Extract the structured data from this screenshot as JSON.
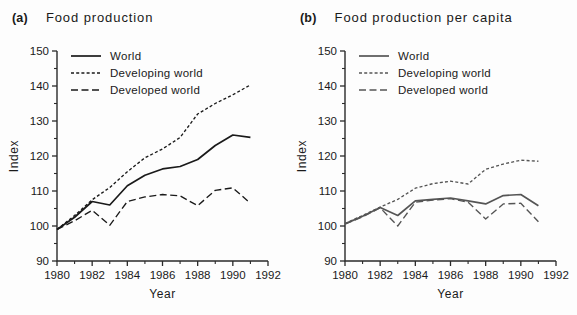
{
  "figure": {
    "background": "#fdfdfd",
    "ink": "#1a1a1a"
  },
  "panels": [
    {
      "tag": "(a)",
      "title": "Food production"
    },
    {
      "tag": "(b)",
      "title": "Food production per capita"
    }
  ],
  "legend": {
    "entries": [
      {
        "label": "World",
        "style": "solid"
      },
      {
        "label": "Developing world",
        "style": "dotted"
      },
      {
        "label": "Developed world",
        "style": "dashed"
      }
    ]
  },
  "axes": {
    "xlabel": "Year",
    "ylabel": "Index",
    "xticks": [
      1980,
      1982,
      1984,
      1986,
      1988,
      1990,
      1992
    ],
    "xtick_labels": [
      "1980",
      "1982",
      "1984",
      "1986",
      "1988",
      "1990",
      "1992"
    ],
    "yticks": [
      90,
      100,
      110,
      120,
      130,
      140,
      150
    ],
    "ytick_labels": [
      "90",
      "100",
      "110",
      "120",
      "130",
      "140",
      "150"
    ],
    "xlim": [
      1980,
      1992
    ],
    "ylim": [
      90,
      150
    ],
    "minor_x_ticks": [
      1981,
      1983,
      1985,
      1987,
      1989,
      1991
    ],
    "minor_y_ticks": [
      95,
      105,
      115,
      125,
      135,
      145
    ],
    "grid": false
  },
  "chart_data": [
    {
      "type": "line",
      "panel": "(a)",
      "title": "Food production",
      "xlabel": "Year",
      "ylabel": "Index",
      "xlim": [
        1980,
        1992
      ],
      "ylim": [
        90,
        150
      ],
      "grid": false,
      "legend_position": "top-left inside axes",
      "x": [
        1980,
        1981,
        1982,
        1983,
        1984,
        1985,
        1986,
        1987,
        1988,
        1989,
        1990,
        1991
      ],
      "series": [
        {
          "name": "World",
          "style": "solid",
          "color": "#1a1a1a",
          "values": [
            99,
            102.5,
            107,
            106,
            111.5,
            114.5,
            116.3,
            117,
            119,
            123,
            126,
            125.3
          ]
        },
        {
          "name": "Developing world",
          "style": "dotted",
          "color": "#1a1a1a",
          "values": [
            99,
            103,
            107.5,
            111,
            115.5,
            119.5,
            122,
            125.3,
            132,
            135,
            137.5,
            140.3
          ]
        },
        {
          "name": "Developed world",
          "style": "dashed",
          "color": "#1a1a1a",
          "values": [
            99,
            101.5,
            104.5,
            100.2,
            107,
            108.3,
            109,
            108.6,
            105.8,
            110.2,
            110.9,
            106.5
          ]
        }
      ]
    },
    {
      "type": "line",
      "panel": "(b)",
      "title": "Food production per capita",
      "xlabel": "Year",
      "ylabel": "Index",
      "xlim": [
        1980,
        1992
      ],
      "ylim": [
        90,
        150
      ],
      "grid": false,
      "legend_position": "top-left inside axes",
      "x": [
        1980,
        1981,
        1982,
        1983,
        1984,
        1985,
        1986,
        1987,
        1988,
        1989,
        1990,
        1991
      ],
      "series": [
        {
          "name": "World",
          "style": "solid",
          "color": "#555555",
          "values": [
            100.6,
            102.8,
            105.3,
            103,
            107.2,
            107.6,
            108,
            107.2,
            106.3,
            108.7,
            109,
            105.8
          ]
        },
        {
          "name": "Developing world",
          "style": "dotted",
          "color": "#555555",
          "values": [
            100.7,
            103,
            105.4,
            107.6,
            110.8,
            112.1,
            112.8,
            112,
            116.2,
            117.7,
            118.8,
            118.5
          ]
        },
        {
          "name": "Developed world",
          "style": "dashed",
          "color": "#555555",
          "values": [
            100.6,
            102.6,
            105.2,
            100,
            106.8,
            107.4,
            107.8,
            106.8,
            102,
            106.3,
            106.5,
            101.2
          ]
        }
      ]
    }
  ]
}
